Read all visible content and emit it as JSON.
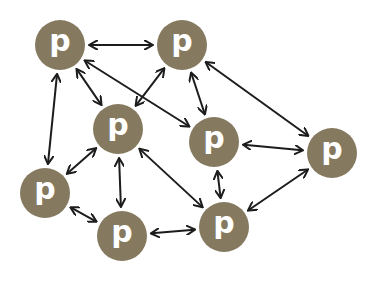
{
  "diagram": {
    "type": "peer-to-peer network",
    "colors": {
      "node": "#857a5f",
      "label": "#ffffff",
      "edge": "#1c1c1c",
      "background": "#ffffff"
    },
    "node_radius": 25,
    "nodes": [
      {
        "id": "n1",
        "label": "p",
        "x": 60,
        "y": 45
      },
      {
        "id": "n2",
        "label": "p",
        "x": 182,
        "y": 45
      },
      {
        "id": "n3",
        "label": "p",
        "x": 118,
        "y": 129
      },
      {
        "id": "n4",
        "label": "p",
        "x": 214,
        "y": 142
      },
      {
        "id": "n5",
        "label": "p",
        "x": 332,
        "y": 153
      },
      {
        "id": "n6",
        "label": "p",
        "x": 45,
        "y": 193
      },
      {
        "id": "n7",
        "label": "p",
        "x": 122,
        "y": 236
      },
      {
        "id": "n8",
        "label": "p",
        "x": 224,
        "y": 227
      }
    ],
    "edges": [
      {
        "from": "n1",
        "to": "n2",
        "bidirectional": true
      },
      {
        "from": "n1",
        "to": "n3",
        "bidirectional": true
      },
      {
        "from": "n1",
        "to": "n4",
        "bidirectional": true
      },
      {
        "from": "n1",
        "to": "n6",
        "bidirectional": true
      },
      {
        "from": "n2",
        "to": "n3",
        "bidirectional": true
      },
      {
        "from": "n2",
        "to": "n4",
        "bidirectional": true
      },
      {
        "from": "n2",
        "to": "n5",
        "bidirectional": true
      },
      {
        "from": "n3",
        "to": "n6",
        "bidirectional": true
      },
      {
        "from": "n3",
        "to": "n7",
        "bidirectional": true
      },
      {
        "from": "n3",
        "to": "n8",
        "bidirectional": true
      },
      {
        "from": "n4",
        "to": "n5",
        "bidirectional": true
      },
      {
        "from": "n4",
        "to": "n8",
        "bidirectional": true
      },
      {
        "from": "n5",
        "to": "n8",
        "bidirectional": true
      },
      {
        "from": "n6",
        "to": "n7",
        "bidirectional": true
      },
      {
        "from": "n7",
        "to": "n8",
        "bidirectional": true
      }
    ]
  }
}
